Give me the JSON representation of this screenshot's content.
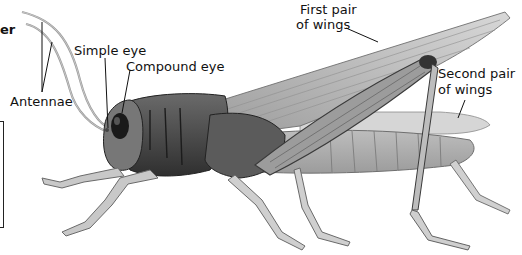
{
  "diagram": {
    "fragment_text": "er",
    "labels": {
      "antennae": "Antennae",
      "simple_eye": "Simple eye",
      "compound_eye": "Compound eye",
      "first_wings_line1": "First pair",
      "first_wings_line2": "of wings",
      "second_wings_line1": "Second pair",
      "second_wings_line2": "of wings"
    },
    "colors": {
      "background": "#ffffff",
      "text": "#111111",
      "leader_line": "#111111",
      "body_dark": "#3a3a3a",
      "body_mid": "#8a8a8a",
      "body_light": "#cfcfcf"
    }
  }
}
